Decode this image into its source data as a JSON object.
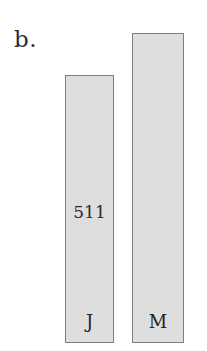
{
  "figure": {
    "panel_label": "b.",
    "background_color": "#ffffff"
  },
  "style": {
    "bar_fill_color": "#dedede",
    "bar_border_color": "#7e7e7e",
    "text_color": "#2a2a2a"
  },
  "chart_data": {
    "type": "bar",
    "title": "b.",
    "xlabel": "",
    "ylabel": "",
    "grid": false,
    "legend": "none",
    "categories": [
      "J",
      "M"
    ],
    "values": [
      511,
      620
    ],
    "data_labels": [
      "511",
      ""
    ],
    "bars": [
      {
        "category": "J",
        "label": "J",
        "value": 511,
        "value_label": "511",
        "value_label_shown": true,
        "fill": "#dedede",
        "border": "#7e7e7e"
      },
      {
        "category": "M",
        "label": "M",
        "value": 620,
        "value_label": "",
        "value_label_shown": false,
        "fill": "#dedede",
        "border": "#7e7e7e"
      }
    ]
  }
}
